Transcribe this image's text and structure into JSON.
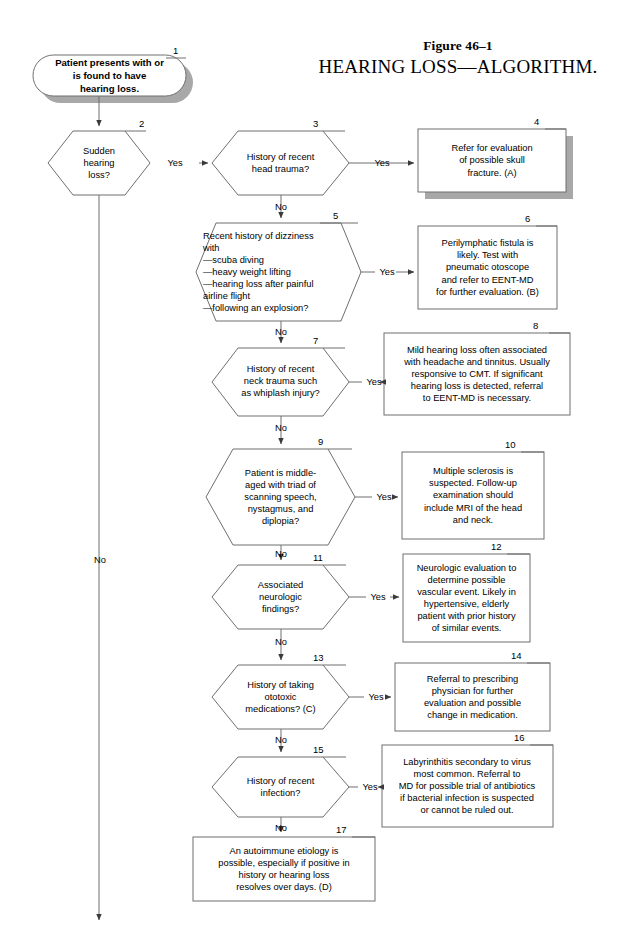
{
  "figure": {
    "label": "Figure 46–1",
    "title": "HEARING LOSS—ALGORITHM."
  },
  "colors": {
    "stroke": "#6f6f6f",
    "shadow": "#a8a8a8",
    "text": "#000000",
    "background": "#ffffff"
  },
  "nodes": [
    {
      "id": "1",
      "number": "1",
      "shape": "stadium",
      "text": "Patient presents with or\nis found to have\nhearing loss.",
      "shadow": true,
      "bold": true
    },
    {
      "id": "2",
      "number": "2",
      "shape": "hexagon",
      "text": "Sudden\nhearing\nloss?",
      "shadow": false,
      "bold": false
    },
    {
      "id": "3",
      "number": "3",
      "shape": "hexagon",
      "text": "History of recent\nhead trauma?",
      "shadow": false,
      "bold": false
    },
    {
      "id": "4",
      "number": "4",
      "shape": "rect",
      "text": "Refer for evaluation\nof possible skull\nfracture. (A)",
      "shadow": true,
      "bold": false
    },
    {
      "id": "5",
      "number": "5",
      "shape": "hexagon",
      "text": "Recent history of dizziness\nwith\n—scuba diving\n—heavy weight lifting\n—hearing loss after painful\n    airline flight\n—following an explosion?",
      "shadow": false,
      "bold": false,
      "align": "left"
    },
    {
      "id": "6",
      "number": "6",
      "shape": "rect",
      "text": "Perilymphatic fistula is\nlikely. Test with\npneumatic otoscope\nand refer to EENT-MD\nfor further evaluation. (B)",
      "shadow": false,
      "bold": false
    },
    {
      "id": "7",
      "number": "7",
      "shape": "hexagon",
      "text": "History of recent\nneck trauma such\nas whiplash injury?",
      "shadow": false,
      "bold": false
    },
    {
      "id": "8",
      "number": "8",
      "shape": "rect",
      "text": "Mild hearing loss often associated\nwith headache and tinnitus. Usually\nresponsive to CMT. If significant\nhearing loss is detected, referral\nto EENT-MD is necessary.",
      "shadow": false,
      "bold": false
    },
    {
      "id": "9",
      "number": "9",
      "shape": "hexagon",
      "text": "Patient is middle-\naged with triad of\nscanning speech,\nnystagmus, and\ndiplopia?",
      "shadow": false,
      "bold": false
    },
    {
      "id": "10",
      "number": "10",
      "shape": "rect",
      "text": "Multiple sclerosis is\nsuspected. Follow-up\nexamination should\ninclude MRI of the head\nand neck.",
      "shadow": false,
      "bold": false
    },
    {
      "id": "11",
      "number": "11",
      "shape": "hexagon",
      "text": "Associated\nneurologic\nfindings?",
      "shadow": false,
      "bold": false
    },
    {
      "id": "12",
      "number": "12",
      "shape": "rect",
      "text": "Neurologic evaluation to\ndetermine possible\nvascular event. Likely in\nhypertensive, elderly\npatient with prior history\nof similar events.",
      "shadow": false,
      "bold": false
    },
    {
      "id": "13",
      "number": "13",
      "shape": "hexagon",
      "text": "History of taking\nototoxic\nmedications? (C)",
      "shadow": false,
      "bold": false
    },
    {
      "id": "14",
      "number": "14",
      "shape": "rect",
      "text": "Referral to prescribing\nphysician for further\nevaluation and possible\nchange in medication.",
      "shadow": false,
      "bold": false
    },
    {
      "id": "15",
      "number": "15",
      "shape": "hexagon",
      "text": "History of recent\ninfection?",
      "shadow": false,
      "bold": false
    },
    {
      "id": "16",
      "number": "16",
      "shape": "rect",
      "text": "Labyrinthitis secondary to virus\nmost common. Referral to\nMD for possible trial of antibiotics\nif bacterial infection is suspected\nor cannot be ruled out.",
      "shadow": false,
      "bold": false
    },
    {
      "id": "17",
      "number": "17",
      "shape": "rect",
      "text": "An autoimmune etiology is\npossible, especially if positive in\nhistory or hearing loss\nresolves over days. (D)",
      "shadow": false,
      "bold": false
    }
  ],
  "edge_labels": [
    {
      "id": "yes-2-3",
      "text": "Yes"
    },
    {
      "id": "yes-3-4",
      "text": "Yes"
    },
    {
      "id": "no-3-5",
      "text": "No"
    },
    {
      "id": "yes-5-6",
      "text": "Yes"
    },
    {
      "id": "no-5-7",
      "text": "No"
    },
    {
      "id": "yes-7-8",
      "text": "Yes"
    },
    {
      "id": "no-7-9",
      "text": "No"
    },
    {
      "id": "yes-9-10",
      "text": "Yes"
    },
    {
      "id": "no-9-11",
      "text": "No"
    },
    {
      "id": "yes-11-12",
      "text": "Yes"
    },
    {
      "id": "no-11-13",
      "text": "No"
    },
    {
      "id": "yes-13-14",
      "text": "Yes"
    },
    {
      "id": "no-13-15",
      "text": "No"
    },
    {
      "id": "yes-15-16",
      "text": "Yes"
    },
    {
      "id": "no-15-17",
      "text": "No"
    },
    {
      "id": "no-2-down",
      "text": "No"
    }
  ]
}
